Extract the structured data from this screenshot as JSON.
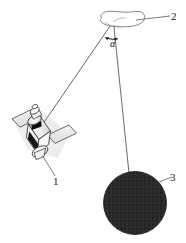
{
  "figure": {
    "type": "technical-line-diagram",
    "background_color": "#ffffff",
    "line_color": "#4a4a4a",
    "title": ""
  },
  "labels": {
    "satellite": "1",
    "target_blob": "2",
    "dark_sphere": "3",
    "angle": "α"
  },
  "objects": {
    "satellite": {
      "name": "satellite",
      "label": "1",
      "body_color": "#f2f2f0",
      "panel_color": "#e8e8e6",
      "dark_band_color": "#111111",
      "outline_color": "#3d3d3d"
    },
    "blob": {
      "name": "irregular-blob-outline",
      "label": "2",
      "fill": "none",
      "outline_color": "#6a6a6a"
    },
    "sphere": {
      "name": "dark-textured-sphere",
      "label": "3",
      "fill_color": "#2b2b2b",
      "texture": "speckled"
    }
  },
  "annotations": {
    "angle_symbol": "α",
    "apex_point": "sight-line-vertex",
    "sight_line_left": "satellite-to-vertex",
    "sight_line_right": "vertex-to-sphere"
  }
}
